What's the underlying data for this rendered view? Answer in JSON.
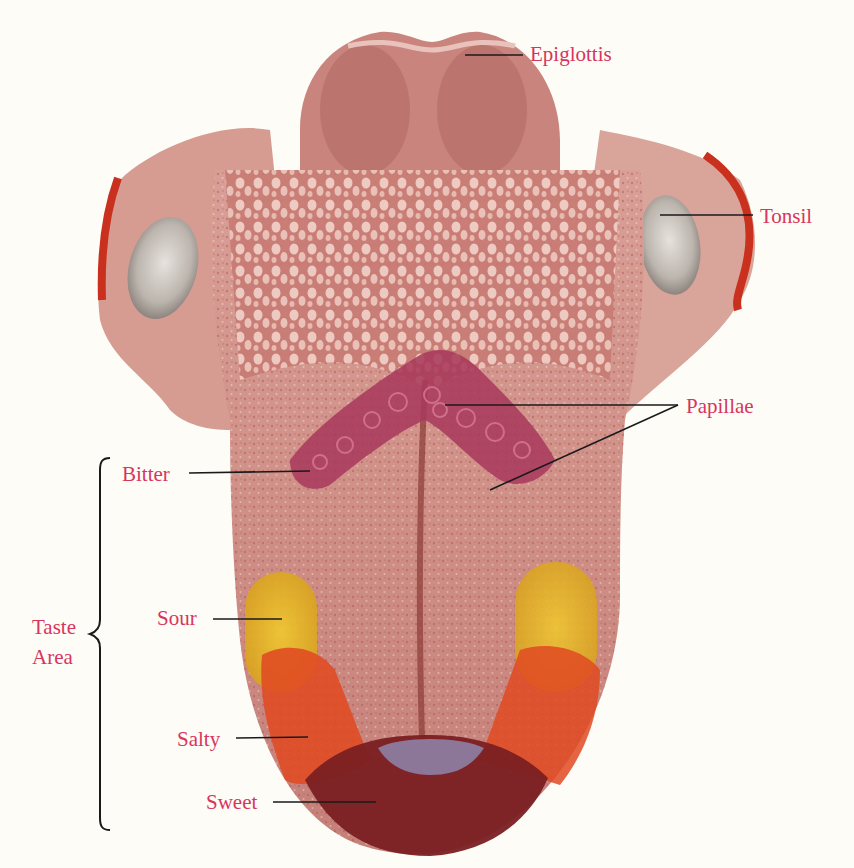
{
  "diagram": {
    "colors": {
      "label_text": "#d8355d",
      "leader_line": "#1a1a1a",
      "background": "#fdfcf7",
      "tongue_base": "#c98a84",
      "tongue_dark": "#9e3f3a",
      "bitter_zone": "#a83a5c",
      "sour_zone": "#e2b62a",
      "salty_zone": "#e04a22",
      "sweet_zone": "#7a1f22",
      "sweet_highlight": "#8f86ad",
      "tonsil": "#c9c3bd",
      "muscle": "#c9301e"
    },
    "labels": {
      "epiglottis": "Epiglottis",
      "tonsil": "Tonsil",
      "papillae": "Papillae",
      "bitter": "Bitter",
      "sour": "Sour",
      "salty": "Salty",
      "sweet": "Sweet",
      "taste_area_line1": "Taste",
      "taste_area_line2": "Area"
    }
  }
}
